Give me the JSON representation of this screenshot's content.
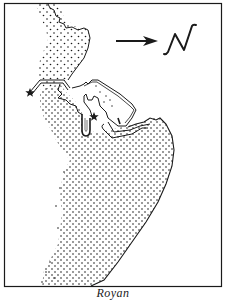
{
  "map": {
    "caption": "Royan",
    "compass": {
      "label": "N",
      "direction": "arrow pointing right toward N"
    },
    "markers": [
      {
        "type": "star",
        "name": "star-west-jetty"
      },
      {
        "type": "star",
        "name": "star-harbour"
      }
    ],
    "colors": {
      "ink": "#1a1a1a",
      "paper": "#ffffff"
    }
  }
}
